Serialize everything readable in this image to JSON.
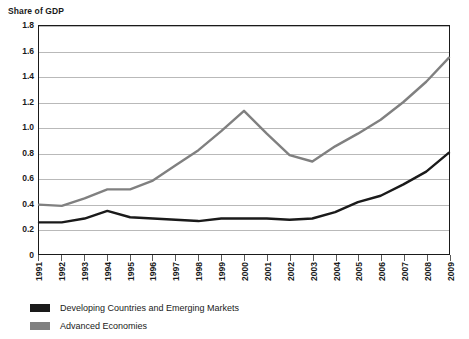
{
  "chart_data": {
    "type": "line",
    "title": "Share of GDP",
    "xlabel": "",
    "ylabel": "Share of GDP",
    "ylim": [
      0,
      1.8
    ],
    "yticks": [
      "0",
      "0.2",
      "0.4",
      "0.6",
      "0.8",
      "1.0",
      "1.2",
      "1.4",
      "1.6",
      "1.8"
    ],
    "ytick_values": [
      0,
      0.2,
      0.4,
      0.6,
      0.8,
      1.0,
      1.2,
      1.4,
      1.6,
      1.8
    ],
    "grid": "horizontal",
    "legend_position": "below",
    "categories": [
      "1991",
      "1992",
      "1993",
      "1994",
      "1995",
      "1996",
      "1997",
      "1998",
      "1999",
      "2000",
      "2001",
      "2002",
      "2003",
      "2004",
      "2005",
      "2006",
      "2007",
      "2008",
      "2009"
    ],
    "series": [
      {
        "name": "Developing Countries and Emerging Markets",
        "color": "#1a1a1a",
        "values": [
          0.25,
          0.25,
          0.28,
          0.34,
          0.29,
          0.28,
          0.27,
          0.26,
          0.28,
          0.28,
          0.28,
          0.27,
          0.28,
          0.33,
          0.41,
          0.46,
          0.55,
          0.65,
          0.8
        ]
      },
      {
        "name": "Advanced Economies",
        "color": "#808080",
        "values": [
          0.39,
          0.38,
          0.44,
          0.51,
          0.51,
          0.58,
          0.7,
          0.82,
          0.97,
          1.13,
          0.95,
          0.78,
          0.73,
          0.85,
          0.95,
          1.06,
          1.2,
          1.36,
          1.55
        ]
      }
    ]
  },
  "legend": {
    "items": [
      {
        "label": "Developing Countries and Emerging Markets",
        "color": "#1a1a1a"
      },
      {
        "label": "Advanced Economies",
        "color": "#808080"
      }
    ]
  }
}
